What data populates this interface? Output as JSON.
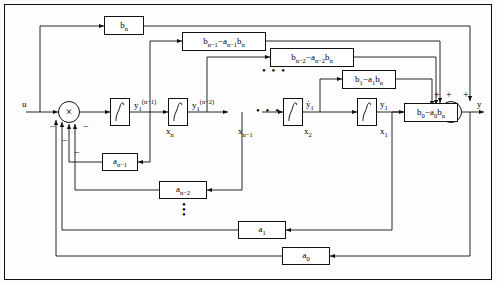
{
  "diagram": {
    "input_label": "u",
    "output_label": "y",
    "gain_boxes": [
      {
        "id": "b_n",
        "html": "b<sub>n</sub>"
      },
      {
        "id": "b_nm1",
        "html": "b<sub>n−1</sub>−a<sub>n−1</sub>b<sub>n</sub>"
      },
      {
        "id": "b_nm2",
        "html": "b<sub>n−2</sub>−a<sub>n−2</sub>b<sub>n</sub>"
      },
      {
        "id": "b_1",
        "html": "b<sub>1</sub>−a<sub>1</sub>b<sub>n</sub>"
      },
      {
        "id": "b_0",
        "html": "b<sub>0</sub>−a<sub>0</sub>b<sub>n</sub>"
      },
      {
        "id": "a_nm1",
        "html": "a<sub>n−1</sub>"
      },
      {
        "id": "a_nm2",
        "html": "a<sub>n−2</sub>"
      },
      {
        "id": "a_1",
        "html": "a<sub>1</sub>"
      },
      {
        "id": "a_0",
        "html": "a<sub>0</sub>"
      }
    ],
    "state_labels": [
      {
        "id": "xn",
        "html": "x<sub>n</sub>"
      },
      {
        "id": "xnm1",
        "html": "x<sub>n−1</sub>"
      },
      {
        "id": "x2",
        "html": "x<sub>2</sub>"
      },
      {
        "id": "x1",
        "html": "x<sub>1</sub>"
      }
    ],
    "deriv_labels": [
      {
        "id": "y1n",
        "html": "y<sub>1</sub><sup>(n−1)</sup>"
      },
      {
        "id": "y1n2",
        "html": "y<sub>1</sub><sup>(n−2)</sup>"
      },
      {
        "id": "y1dot",
        "html": "ẏ<sub>1</sub>"
      },
      {
        "id": "y1",
        "html": "y<sub>1</sub>"
      }
    ],
    "ellipsis_h": "• • •",
    "ellipsis_v": "•",
    "signs": {
      "minus": "−",
      "plus": "+"
    },
    "summing_junctions": [
      {
        "id": "sum-left",
        "symbol": "×",
        "signs": [
          "−",
          "−",
          "−",
          "−"
        ]
      },
      {
        "id": "sum-right",
        "symbol": "×",
        "signs": [
          "+",
          "+",
          "+",
          "+"
        ]
      }
    ],
    "integrator_symbol": "∫",
    "colors": {
      "line": "#111111",
      "background": "#fdfdfd",
      "box_fill": "#ffffff"
    }
  }
}
